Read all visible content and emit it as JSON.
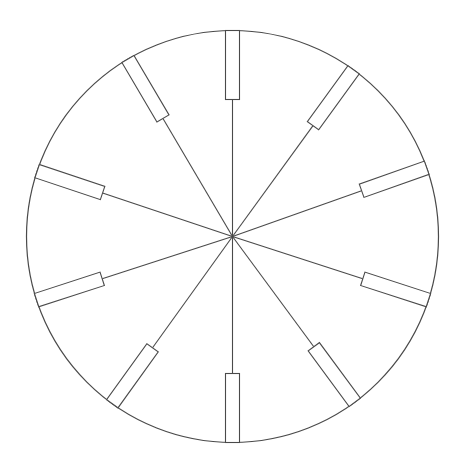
{
  "diagram": {
    "type": "circle-with-radial-spokes",
    "background": "#ffffff",
    "stroke_color": "#4a4a4a",
    "center": [
      232.5,
      236.5
    ],
    "radius": 206,
    "spoke_count": 10,
    "spokes": [
      {
        "angle_deg": -90
      },
      {
        "angle_deg": -54
      },
      {
        "angle_deg": -19.5
      },
      {
        "angle_deg": 18
      },
      {
        "angle_deg": 53.6
      },
      {
        "angle_deg": 90
      },
      {
        "angle_deg": 125.7
      },
      {
        "angle_deg": 162
      },
      {
        "angle_deg": 198.5
      },
      {
        "angle_deg": 239.5
      }
    ],
    "rect_length": 69,
    "rect_width": 14
  }
}
